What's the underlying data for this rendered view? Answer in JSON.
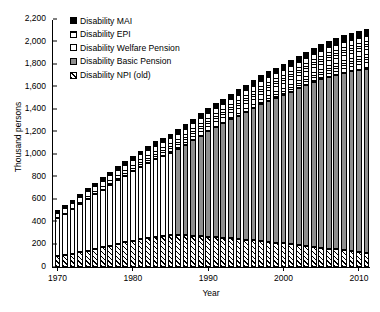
{
  "chart_data": {
    "type": "bar",
    "title": "",
    "subtitle": "",
    "xlabel": "Year",
    "ylabel": "Thousand persons",
    "stacked": true,
    "grid": false,
    "legend_position": "top-left",
    "ylim": [
      0,
      2200
    ],
    "ytick_step": 200,
    "yticks": [
      0,
      200,
      400,
      600,
      800,
      1000,
      1200,
      1400,
      1600,
      1800,
      2000,
      2200
    ],
    "ytick_labels": [
      "0",
      "200",
      "400",
      "600",
      "800",
      "1,000",
      "1,200",
      "1,400",
      "1,600",
      "1,800",
      "2,000",
      "2,200"
    ],
    "xticks": [
      1970,
      1980,
      1990,
      2000,
      2010
    ],
    "xtick_labels": [
      "1970",
      "1980",
      "1990",
      "2000",
      "2010"
    ],
    "xlim": [
      1969.4,
      2011.6
    ],
    "categories": [
      1970,
      1971,
      1972,
      1973,
      1974,
      1975,
      1976,
      1977,
      1978,
      1979,
      1980,
      1981,
      1982,
      1983,
      1984,
      1985,
      1986,
      1987,
      1988,
      1989,
      1990,
      1991,
      1992,
      1993,
      1994,
      1995,
      1996,
      1997,
      1998,
      1999,
      2000,
      2001,
      2002,
      2003,
      2004,
      2005,
      2006,
      2007,
      2008,
      2009,
      2010,
      2011
    ],
    "series": [
      {
        "name": "Disability NPI (old)",
        "pattern": "diagonal-hatch",
        "color": "#ffffff",
        "values": [
          95,
          105,
          118,
          130,
          145,
          160,
          175,
          190,
          205,
          218,
          232,
          245,
          255,
          265,
          272,
          280,
          285,
          282,
          278,
          274,
          270,
          265,
          260,
          254,
          248,
          242,
          236,
          230,
          223,
          216,
          209,
          202,
          195,
          188,
          180,
          172,
          164,
          156,
          148,
          140,
          132,
          124
        ]
      },
      {
        "name": "Disability Basic Pension",
        "pattern": "solid-gray",
        "color": "#8e8e8e",
        "values": [
          0,
          0,
          0,
          0,
          0,
          0,
          0,
          0,
          0,
          0,
          0,
          0,
          0,
          0,
          0,
          0,
          760,
          800,
          845,
          890,
          935,
          975,
          1015,
          1055,
          1095,
          1135,
          1175,
          1215,
          1250,
          1285,
          1320,
          1355,
          1390,
          1425,
          1460,
          1495,
          1525,
          1550,
          1575,
          1600,
          1620,
          1635
        ]
      },
      {
        "name": "Disability Welfare Pension",
        "pattern": "white",
        "color": "#ffffff",
        "values": [
          340,
          368,
          398,
          428,
          458,
          486,
          512,
          540,
          566,
          592,
          618,
          645,
          668,
          692,
          712,
          730,
          0,
          0,
          0,
          0,
          0,
          0,
          0,
          0,
          0,
          0,
          0,
          0,
          0,
          0,
          0,
          0,
          0,
          0,
          0,
          0,
          0,
          0,
          0,
          0,
          0,
          0
        ]
      },
      {
        "name": "Disability EPI",
        "pattern": "horizontal-stripe",
        "color": "#ffffff",
        "values": [
          52,
          58,
          64,
          70,
          76,
          82,
          88,
          94,
          100,
          106,
          112,
          118,
          124,
          130,
          136,
          142,
          148,
          154,
          160,
          166,
          172,
          178,
          184,
          190,
          196,
          202,
          208,
          214,
          220,
          226,
          232,
          238,
          244,
          250,
          256,
          262,
          268,
          274,
          280,
          286,
          292,
          298
        ]
      },
      {
        "name": "Disability MAI",
        "pattern": "solid-black",
        "color": "#000000",
        "values": [
          14,
          15,
          16,
          17,
          18,
          19,
          20,
          21,
          22,
          23,
          24,
          25,
          26,
          27,
          28,
          29,
          30,
          31,
          32,
          33,
          34,
          35,
          36,
          37,
          38,
          39,
          40,
          41,
          42,
          43,
          44,
          45,
          46,
          47,
          48,
          49,
          50,
          51,
          52,
          53,
          54,
          55
        ]
      }
    ],
    "legend": [
      {
        "label": "Disability MAI",
        "swatch": "solid-black"
      },
      {
        "label": "Disability EPI",
        "swatch": "horizontal-stripe"
      },
      {
        "label": "Disability Welfare Pension",
        "swatch": "white"
      },
      {
        "label": "Disability Basic Pension",
        "swatch": "solid-gray"
      },
      {
        "label": "Disability NPI (old)",
        "swatch": "diagonal-hatch"
      }
    ]
  }
}
